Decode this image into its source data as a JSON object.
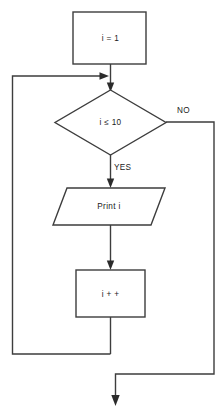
{
  "diagram": {
    "type": "flowchart",
    "colors": {
      "background": "#ffffff",
      "stroke": "#3d3d3d",
      "text": "#1a1a1a",
      "arrow": "#2b2b2b"
    },
    "nodes": {
      "init": {
        "shape": "process-rectangle",
        "label": "i = 1"
      },
      "decision": {
        "shape": "decision-diamond",
        "label": "i ≤ 10"
      },
      "print": {
        "shape": "io-parallelogram",
        "label": "Print i"
      },
      "increment": {
        "shape": "process-rectangle",
        "label": "i + +"
      }
    },
    "branch_labels": {
      "no": "NO",
      "yes": "YES"
    }
  }
}
